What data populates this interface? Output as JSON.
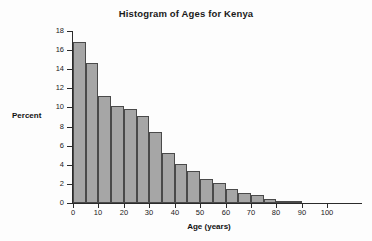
{
  "chart_data": {
    "type": "bar",
    "title": "Histogram of Ages for Kenya",
    "xlabel": "Age (years)",
    "ylabel": "Percent",
    "xlim": [
      0,
      107
    ],
    "ylim": [
      0,
      18
    ],
    "grid": false,
    "legend": null,
    "bin_width": 5,
    "bar_fill_color": "#a6a6a6",
    "bar_border_color": "#4a4a4a",
    "axis_color": "#2b2b2b",
    "background_color": "#fdfdfd",
    "x_ticks": [
      0,
      10,
      20,
      30,
      40,
      50,
      60,
      70,
      80,
      90,
      100
    ],
    "x_tick_labels": [
      "0",
      "10",
      "20",
      "30",
      "40",
      "50",
      "60",
      "70",
      "80",
      "90",
      "100"
    ],
    "y_ticks": [
      0,
      2,
      4,
      6,
      8,
      10,
      12,
      14,
      16,
      18
    ],
    "y_tick_labels": [
      "0",
      "2",
      "4",
      "6",
      "8",
      "10",
      "12",
      "14",
      "16",
      "18"
    ],
    "bins": [
      {
        "start": 0,
        "end": 5,
        "label": "0-5",
        "value": 16.8
      },
      {
        "start": 5,
        "end": 10,
        "label": "5-10",
        "value": 14.7
      },
      {
        "start": 10,
        "end": 15,
        "label": "10-15",
        "value": 11.2
      },
      {
        "start": 15,
        "end": 20,
        "label": "15-20",
        "value": 10.2
      },
      {
        "start": 20,
        "end": 25,
        "label": "20-25",
        "value": 9.8
      },
      {
        "start": 25,
        "end": 30,
        "label": "25-30",
        "value": 9.1
      },
      {
        "start": 30,
        "end": 35,
        "label": "30-35",
        "value": 7.4
      },
      {
        "start": 35,
        "end": 40,
        "label": "35-40",
        "value": 5.2
      },
      {
        "start": 40,
        "end": 45,
        "label": "40-45",
        "value": 4.05
      },
      {
        "start": 45,
        "end": 50,
        "label": "45-50",
        "value": 3.3
      },
      {
        "start": 50,
        "end": 55,
        "label": "50-55",
        "value": 2.55
      },
      {
        "start": 55,
        "end": 60,
        "label": "55-60",
        "value": 2.05
      },
      {
        "start": 60,
        "end": 65,
        "label": "60-65",
        "value": 1.5
      },
      {
        "start": 65,
        "end": 70,
        "label": "65-70",
        "value": 1.1
      },
      {
        "start": 70,
        "end": 75,
        "label": "70-75",
        "value": 0.8
      },
      {
        "start": 75,
        "end": 80,
        "label": "75-80",
        "value": 0.45
      },
      {
        "start": 80,
        "end": 85,
        "label": "80-85",
        "value": 0.25
      },
      {
        "start": 85,
        "end": 90,
        "label": "85-90",
        "value": 0.1
      }
    ]
  }
}
